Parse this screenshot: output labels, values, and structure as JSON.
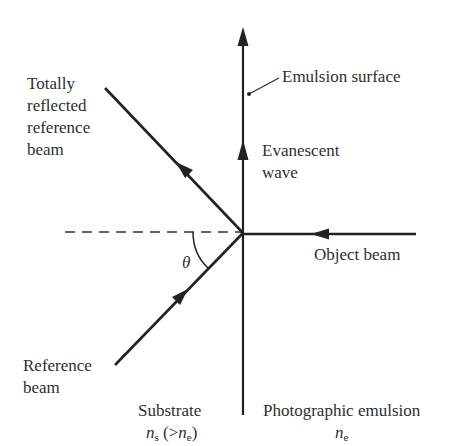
{
  "diagram": {
    "type": "optical-geometry",
    "labels": {
      "totally_reflected": [
        "Totally",
        "reflected",
        "reference",
        "beam"
      ],
      "emulsion_surface": "Emulsion surface",
      "evanescent_wave": [
        "Evanescent",
        "wave"
      ],
      "object_beam": "Object beam",
      "angle_symbol": "θ",
      "reference_beam": [
        "Reference",
        "beam"
      ],
      "substrate": {
        "name": "Substrate",
        "index_symbol": "n",
        "index_sub": "s",
        "relation_open": " (>",
        "relation_symbol": "n",
        "relation_sub": "e",
        "relation_close": ")"
      },
      "emulsion": {
        "name": "Photographic emulsion",
        "index_symbol": "n",
        "index_sub": "e"
      }
    },
    "colors": {
      "line": "#222222",
      "text": "#2f2f2f",
      "background": "#ffffff"
    },
    "geometry": {
      "interface_x": 243,
      "interface_top": 30,
      "interface_bottom": 415,
      "intersection": [
        243,
        233
      ],
      "dashed_normal": [
        [
          65,
          232
        ],
        [
          243,
          232
        ]
      ],
      "reflected_beam": [
        [
          105,
          88
        ],
        [
          243,
          233
        ]
      ],
      "reference_beam": [
        [
          115,
          365
        ],
        [
          243,
          233
        ]
      ],
      "object_beam": [
        [
          415,
          234
        ],
        [
          243,
          234
        ]
      ]
    }
  }
}
